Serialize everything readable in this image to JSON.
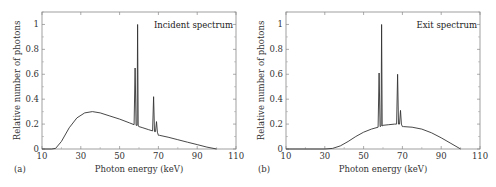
{
  "chart_data": [
    {
      "type": "line",
      "panel_label": "(a)",
      "title": "Incident spectrum",
      "xlabel": "Photon energy (keV)",
      "ylabel": "Relative number of photons",
      "xlim": [
        10,
        110
      ],
      "ylim": [
        0,
        1.1
      ],
      "xticks": [
        10,
        30,
        50,
        70,
        90,
        110
      ],
      "yticks": [
        0,
        0.2,
        0.4,
        0.6,
        0.8,
        1
      ],
      "ytick_labels": [
        "0",
        "0.2",
        "0.4",
        "0.6",
        "0.8",
        "1"
      ],
      "grid": false,
      "legend_position": "upper right",
      "x": [
        10,
        15,
        17,
        20,
        24,
        28,
        32,
        36,
        40,
        45,
        50,
        55,
        57.5,
        58,
        58.5,
        59,
        59.3,
        59.6,
        60,
        62,
        65,
        67,
        67.5,
        68,
        68.5,
        69,
        69.5,
        70,
        70.5,
        75,
        80,
        85,
        90,
        95,
        100
      ],
      "y": [
        0,
        0,
        0.005,
        0.06,
        0.17,
        0.25,
        0.29,
        0.3,
        0.29,
        0.265,
        0.24,
        0.21,
        0.195,
        0.65,
        0.19,
        0.19,
        1.0,
        0.185,
        0.18,
        0.17,
        0.155,
        0.145,
        0.42,
        0.14,
        0.14,
        0.22,
        0.135,
        0.11,
        0.11,
        0.095,
        0.075,
        0.055,
        0.035,
        0.015,
        0
      ]
    },
    {
      "type": "line",
      "panel_label": "(b)",
      "title": "Exit spectrum",
      "xlabel": "Photon energy (keV)",
      "ylabel": "Relative number of photons",
      "xlim": [
        10,
        110
      ],
      "ylim": [
        0,
        1.1
      ],
      "xticks": [
        10,
        30,
        50,
        70,
        90,
        110
      ],
      "yticks": [
        0,
        0.2,
        0.4,
        0.6,
        0.8,
        1
      ],
      "ytick_labels": [
        "0",
        "0.2",
        "0.4",
        "0.6",
        "0.8",
        "1"
      ],
      "grid": false,
      "legend_position": "upper right",
      "x": [
        10,
        30,
        34,
        38,
        42,
        46,
        50,
        54,
        57.5,
        58,
        58.5,
        59,
        59.3,
        59.6,
        60,
        63,
        66,
        67,
        67.5,
        68,
        68.5,
        69,
        69.5,
        70,
        70.5,
        75,
        80,
        85,
        90,
        95,
        100
      ],
      "y": [
        0,
        0,
        0.005,
        0.025,
        0.06,
        0.1,
        0.135,
        0.16,
        0.175,
        0.61,
        0.18,
        0.185,
        1.0,
        0.185,
        0.19,
        0.195,
        0.2,
        0.2,
        0.6,
        0.2,
        0.2,
        0.31,
        0.2,
        0.18,
        0.18,
        0.175,
        0.16,
        0.13,
        0.09,
        0.045,
        0
      ]
    }
  ]
}
